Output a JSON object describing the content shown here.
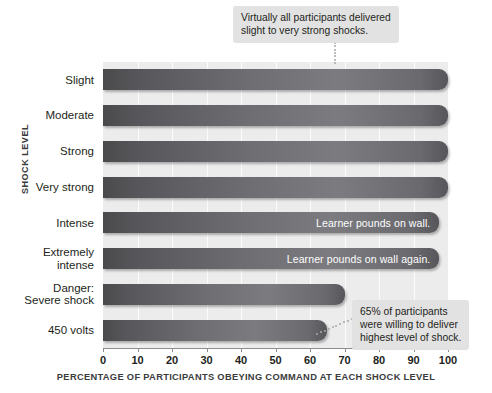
{
  "chart_data": {
    "type": "bar",
    "orientation": "horizontal",
    "title": "",
    "xlabel": "PERCENTAGE OF PARTICIPANTS OBEYING COMMAND AT EACH SHOCK LEVEL",
    "ylabel": "SHOCK LEVEL",
    "categories": [
      "Slight",
      "Moderate",
      "Strong",
      "Very strong",
      "Intense",
      "Extremely intense",
      "Danger: Severe shock",
      "450 volts"
    ],
    "values": [
      100,
      100,
      100,
      100,
      97.5,
      97.5,
      70,
      65
    ],
    "xlim": [
      0,
      100
    ],
    "xticks": [
      0,
      10,
      20,
      30,
      40,
      50,
      60,
      70,
      80,
      90,
      100
    ],
    "xticklabels": [
      "0",
      "10",
      "20",
      "30",
      "40",
      "50",
      "60",
      "70",
      "80",
      "90",
      "100"
    ],
    "grid": "vertical",
    "legend": "none",
    "bar_color": "#6e6e72",
    "plot_background": "#ececec",
    "annotations": [
      {
        "name": "virtually-all-callout",
        "lines": [
          "Virtually all participants delivered",
          "slight to very strong shocks."
        ],
        "points_to_category": "Slight"
      },
      {
        "name": "sixty-five-percent-callout",
        "lines": [
          "65% of participants",
          "were willing to deliver",
          "highest level of shock."
        ],
        "points_to_category": "450 volts"
      },
      {
        "name": "learner-pounds-wall",
        "text": "Learner pounds on wall.",
        "category": "Intense"
      },
      {
        "name": "learner-pounds-wall-again",
        "text": "Learner pounds on wall again.",
        "category": "Extremely intense"
      }
    ]
  },
  "category_label_lines": [
    [
      "Slight"
    ],
    [
      "Moderate"
    ],
    [
      "Strong"
    ],
    [
      "Very strong"
    ],
    [
      "Intense"
    ],
    [
      "Extremely",
      "intense"
    ],
    [
      "Danger:",
      "Severe shock"
    ],
    [
      "450 volts"
    ]
  ]
}
